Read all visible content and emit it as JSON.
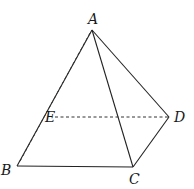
{
  "diagram": {
    "type": "pyramid",
    "vertices": {
      "A": {
        "label": "A",
        "x": 92,
        "y": 30,
        "lx": 90,
        "ly": 24
      },
      "B": {
        "label": "B",
        "x": 17,
        "y": 166,
        "lx": 2,
        "ly": 174
      },
      "C": {
        "label": "C",
        "x": 133,
        "y": 167,
        "lx": 129,
        "ly": 183
      },
      "D": {
        "label": "D",
        "x": 169,
        "y": 117,
        "lx": 175,
        "ly": 122
      },
      "E": {
        "label": "E",
        "x": 52,
        "y": 117,
        "lx": 46,
        "ly": 122
      }
    },
    "solid_edges": [
      [
        "A",
        "B"
      ],
      [
        "A",
        "C"
      ],
      [
        "A",
        "D"
      ],
      [
        "B",
        "C"
      ],
      [
        "C",
        "D"
      ]
    ],
    "dashed_edges": [
      [
        "A",
        "Bd"
      ],
      [
        "E",
        "D"
      ]
    ],
    "labels": {
      "A": "A",
      "B": "B",
      "C": "C",
      "D": "D",
      "E": "E"
    }
  }
}
